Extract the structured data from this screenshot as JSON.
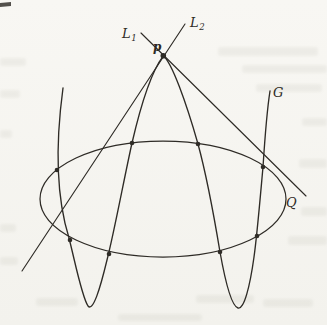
{
  "figure": {
    "type": "math-diagram",
    "ink_color": "#2e2b26",
    "paper_color": "#f8f7f3",
    "labels": {
      "p": "p",
      "L1_main": "L",
      "L1_sub": "1",
      "L2_main": "L",
      "L2_sub": "2",
      "G": "G",
      "Q": "Q"
    },
    "conic_Q": {
      "cx": 163,
      "cy": 199,
      "rx": 123,
      "ry": 58
    },
    "line_L1": {
      "x1": 141,
      "y1": 33,
      "x2": 306,
      "y2": 196
    },
    "line_L2": {
      "x1": 185,
      "y1": 24,
      "x2": 22,
      "y2": 271
    },
    "curve_G_path": "M 63,88 C 56,140 55,193 69,238 C 76,266 82,297 88,306 C 93,312 100,289 107,260 C 114,233 124,179 132,143 C 141,104 151,72 163.3,55.8 C 172,63 186,102 198,144 C 207,177 215,222 220,252 C 225,280 231,306 238,308 C 244,310 250,286 254,257 C 257,236 260,200 263,167 C 265,136 267,110 270,91",
    "node_p": {
      "x": 163.3,
      "y": 55.8,
      "r": 2.8
    },
    "intersection_dots": [
      [
        57,
        170
      ],
      [
        70,
        240
      ],
      [
        109,
        254
      ],
      [
        132,
        143
      ],
      [
        198,
        144
      ],
      [
        220,
        252
      ],
      [
        257,
        236
      ],
      [
        263,
        167
      ]
    ],
    "dot_radius": 2.3,
    "corner_mark": {
      "x": 0,
      "y": 2,
      "w": 11,
      "h": 5
    },
    "smudges": [
      [
        218,
        47,
        100,
        9
      ],
      [
        242,
        65,
        85,
        8
      ],
      [
        256,
        84,
        66,
        8
      ],
      [
        0,
        58,
        26,
        8
      ],
      [
        0,
        90,
        20,
        8
      ],
      [
        302,
        118,
        25,
        8
      ],
      [
        0,
        130,
        12,
        8
      ],
      [
        299,
        159,
        28,
        9
      ],
      [
        301,
        207,
        26,
        9
      ],
      [
        0,
        224,
        16,
        8
      ],
      [
        0,
        257,
        18,
        8
      ],
      [
        288,
        236,
        39,
        9
      ],
      [
        36,
        298,
        42,
        8
      ],
      [
        196,
        295,
        58,
        8
      ],
      [
        263,
        299,
        50,
        8
      ],
      [
        118,
        314,
        84,
        7
      ]
    ]
  }
}
